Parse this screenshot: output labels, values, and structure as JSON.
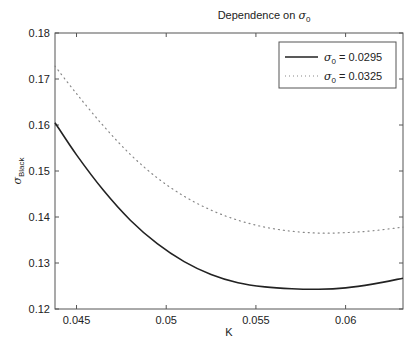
{
  "chart_data": {
    "type": "line",
    "title": "Dependence on σ0",
    "title_parts": {
      "prefix": "Dependence on ",
      "symbol": "σ",
      "subscript": "0"
    },
    "xlabel": "K",
    "ylabel": "σBlack",
    "ylabel_parts": {
      "symbol": "σ",
      "subscript": "Black"
    },
    "xlim": [
      0.0438,
      0.0632
    ],
    "ylim": [
      0.12,
      0.18
    ],
    "xticks": [
      0.045,
      0.05,
      0.055,
      0.06
    ],
    "xtick_labels": [
      "0.045",
      "0.05",
      "0.055",
      "0.06"
    ],
    "yticks": [
      0.12,
      0.13,
      0.14,
      0.15,
      0.16,
      0.17,
      0.18
    ],
    "ytick_labels": [
      "0.12",
      "0.13",
      "0.14",
      "0.15",
      "0.16",
      "0.17",
      "0.18"
    ],
    "grid": false,
    "legend_position": "upper right",
    "x": [
      0.0438,
      0.045,
      0.0465,
      0.048,
      0.0495,
      0.051,
      0.0525,
      0.054,
      0.0555,
      0.057,
      0.0585,
      0.06,
      0.0615,
      0.0632
    ],
    "series": [
      {
        "name": "σ0 = 0.0295",
        "legend_parts": {
          "symbol": "σ",
          "subscript": "0",
          "value": " = 0.0295"
        },
        "style": "solid",
        "color": "#222222",
        "values": [
          0.1605,
          0.1535,
          0.1458,
          0.1393,
          0.1342,
          0.1303,
          0.1275,
          0.1257,
          0.1248,
          0.1244,
          0.1243,
          0.1246,
          0.1254,
          0.1267
        ]
      },
      {
        "name": "σ0 = 0.0325",
        "legend_parts": {
          "symbol": "σ",
          "subscript": "0",
          "value": " = 0.0325"
        },
        "style": "dotted",
        "color": "#888888",
        "values": [
          0.1728,
          0.1668,
          0.1598,
          0.1536,
          0.1485,
          0.1445,
          0.1415,
          0.1393,
          0.1378,
          0.1369,
          0.1365,
          0.1366,
          0.137,
          0.1378
        ]
      }
    ]
  }
}
